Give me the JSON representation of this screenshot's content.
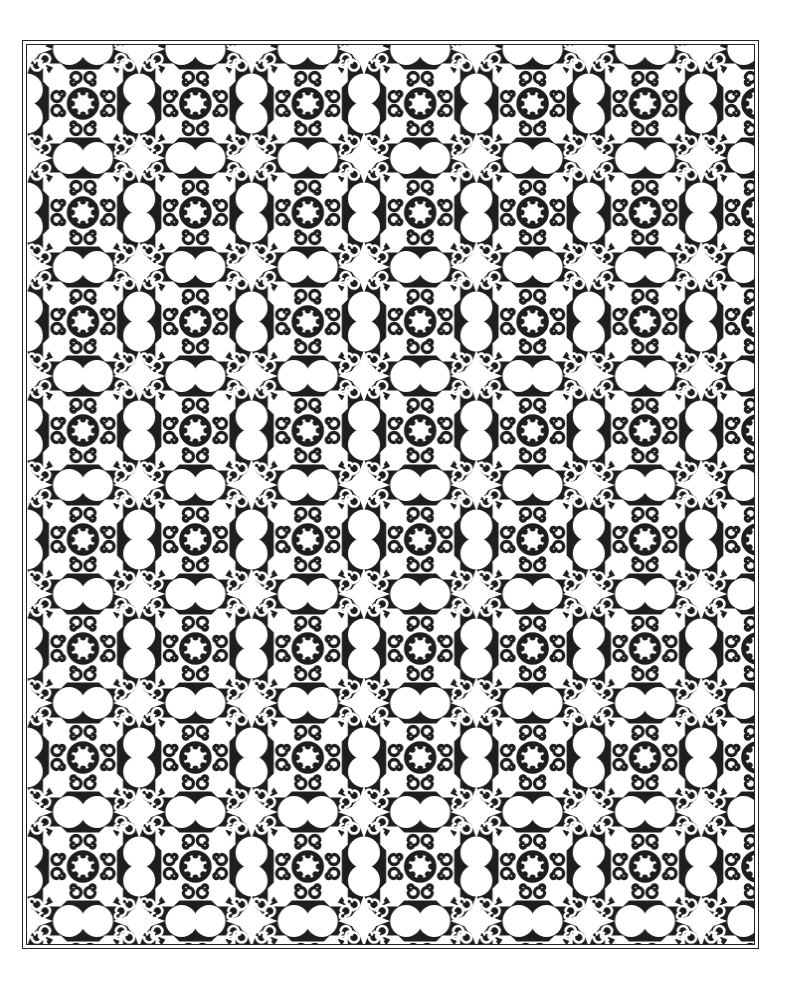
{
  "artwork": {
    "type": "ornamental-tile-pattern",
    "style": "black-and-white coloring page",
    "motifs": [
      "medallion-rosette",
      "spiral-scrolls",
      "double-lobe",
      "four-point-star"
    ],
    "grid": {
      "columns": 6,
      "rows": 8,
      "tile_width": 112.4,
      "tile_height": 109
    },
    "colors": {
      "ink": "#1e1e1e",
      "paper": "#ffffff",
      "frame": "#222222"
    }
  }
}
